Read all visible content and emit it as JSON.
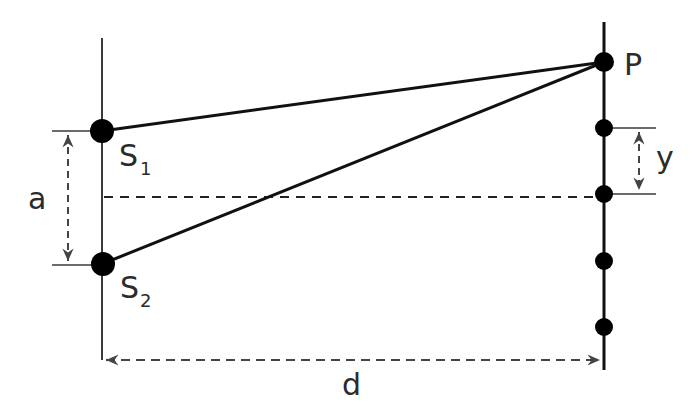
{
  "diagram": {
    "type": "double-slit interference geometry",
    "colors": {
      "line": "#111111",
      "dimension": "#444444",
      "text": "#2b2b2b",
      "background": "#ffffff"
    },
    "labels": {
      "source_1": "S",
      "source_1_sub": "1",
      "source_2": "S",
      "source_2_sub": "2",
      "point": "P",
      "slit_separation": "a",
      "fringe_spacing": "y",
      "screen_distance": "d"
    },
    "elements": {
      "slit_screen": "vertical line with two sources S1 and S2",
      "detection_screen": "vertical line with point P and fringe dots",
      "rays": [
        "S1 to P",
        "S2 to P"
      ],
      "centerline": "dashed horizontal line midway between S1 and S2",
      "dimensions": [
        "a: separation between S1 and S2",
        "y: fringe spacing on screen",
        "d: distance from slits to screen"
      ]
    }
  }
}
